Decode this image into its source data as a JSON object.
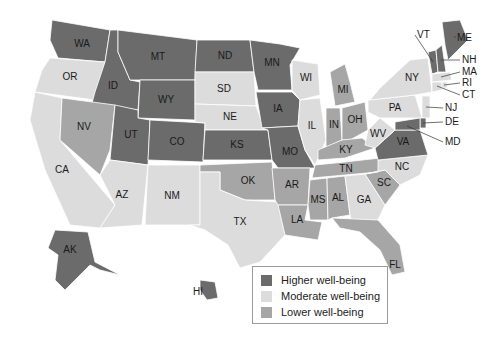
{
  "colors": {
    "higher": "#6b6b6b",
    "moderate": "#dcdcdc",
    "lower": "#a6a6a6"
  },
  "legend": {
    "items": [
      {
        "key": "higher",
        "label": "Higher well-being"
      },
      {
        "key": "moderate",
        "label": "Moderate well-being"
      },
      {
        "key": "lower",
        "label": "Lower well-being"
      }
    ]
  },
  "states": [
    {
      "code": "WA",
      "level": "higher",
      "pts": "52,20 110,30 105,62 58,58 50,40",
      "lx": 82,
      "ly": 44
    },
    {
      "code": "OR",
      "level": "moderate",
      "pts": "50,58 105,62 95,100 35,92 42,70",
      "lx": 70,
      "ly": 77
    },
    {
      "code": "CA",
      "level": "moderate",
      "pts": "35,92 62,98 60,140 115,205 100,228 70,225 45,170 30,120",
      "lx": 62,
      "ly": 170
    },
    {
      "code": "ID",
      "level": "higher",
      "pts": "110,30 118,30 118,52 130,80 140,82 138,110 92,103 95,92 105,62",
      "lx": 113,
      "ly": 86
    },
    {
      "code": "NV",
      "level": "lower",
      "pts": "62,98 115,105 110,150 100,175 60,140",
      "lx": 84,
      "ly": 127
    },
    {
      "code": "MT",
      "level": "higher",
      "pts": "118,30 197,40 195,80 140,80 130,80 118,52",
      "lx": 158,
      "ly": 57
    },
    {
      "code": "WY",
      "level": "higher",
      "pts": "140,80 195,80 195,120 138,118",
      "lx": 166,
      "ly": 100
    },
    {
      "code": "UT",
      "level": "higher",
      "pts": "115,105 138,110 138,118 150,120 148,165 110,160",
      "lx": 131,
      "ly": 135
    },
    {
      "code": "AZ",
      "level": "moderate",
      "pts": "110,160 148,165 142,225 100,228 115,205 100,175",
      "lx": 122,
      "ly": 195
    },
    {
      "code": "CO",
      "level": "higher",
      "pts": "150,120 205,123 203,162 148,160",
      "lx": 177,
      "ly": 142
    },
    {
      "code": "NM",
      "level": "moderate",
      "pts": "148,165 200,165 200,225 145,225",
      "lx": 172,
      "ly": 196
    },
    {
      "code": "ND",
      "level": "higher",
      "pts": "197,40 250,40 254,72 195,72",
      "lx": 225,
      "ly": 56
    },
    {
      "code": "SD",
      "level": "moderate",
      "pts": "195,72 254,72 256,106 195,104",
      "lx": 224,
      "ly": 89
    },
    {
      "code": "NE",
      "level": "moderate",
      "pts": "195,104 256,106 265,130 205,130 205,123 195,122",
      "lx": 230,
      "ly": 117
    },
    {
      "code": "KS",
      "level": "higher",
      "pts": "205,130 268,130 272,160 203,160",
      "lx": 237,
      "ly": 145
    },
    {
      "code": "OK",
      "level": "lower",
      "pts": "200,165 272,162 275,200 245,200 220,190 220,172 200,172",
      "lx": 248,
      "ly": 181
    },
    {
      "code": "TX",
      "level": "moderate",
      "pts": "200,172 220,172 220,190 245,200 278,202 285,235 260,262 240,268 228,245 205,230 190,225 200,225",
      "lx": 240,
      "ly": 222
    },
    {
      "code": "MN",
      "level": "higher",
      "pts": "250,40 280,44 300,48 290,65 292,90 258,90 254,72",
      "lx": 272,
      "ly": 63
    },
    {
      "code": "IA",
      "level": "higher",
      "pts": "256,92 292,92 300,100 298,126 262,128",
      "lx": 278,
      "ly": 109
    },
    {
      "code": "MO",
      "level": "higher",
      "pts": "262,128 298,126 305,150 315,168 278,168 272,160 268,130",
      "lx": 290,
      "ly": 152
    },
    {
      "code": "AR",
      "level": "lower",
      "pts": "272,168 310,168 308,205 278,205 275,200",
      "lx": 292,
      "ly": 185
    },
    {
      "code": "LA",
      "level": "lower",
      "pts": "278,205 308,205 305,220 322,222 318,240 285,235",
      "lx": 297,
      "ly": 220
    },
    {
      "code": "WI",
      "level": "moderate",
      "pts": "292,60 318,64 320,95 300,100 292,90",
      "lx": 306,
      "ly": 78
    },
    {
      "code": "IL",
      "level": "moderate",
      "pts": "300,100 320,98 326,140 315,165 305,150 298,126",
      "lx": 312,
      "ly": 126
    },
    {
      "code": "MI",
      "level": "lower",
      "pts": "330,72 345,64 350,82 355,102 335,106",
      "lx": 343,
      "ly": 90
    },
    {
      "code": "IN",
      "level": "lower",
      "pts": "326,108 340,108 342,140 326,148 326,140",
      "lx": 334,
      "ly": 125
    },
    {
      "code": "OH",
      "level": "lower",
      "pts": "342,108 365,102 368,130 350,140 342,140",
      "lx": 355,
      "ly": 120
    },
    {
      "code": "KY",
      "level": "lower",
      "pts": "318,150 342,140 362,138 375,148 345,158 318,160",
      "lx": 346,
      "ly": 150
    },
    {
      "code": "TN",
      "level": "lower",
      "pts": "315,165 345,162 380,158 378,172 312,178",
      "lx": 346,
      "ly": 169
    },
    {
      "code": "MS",
      "level": "lower",
      "pts": "310,180 327,178 328,220 310,220 308,205",
      "lx": 318,
      "ly": 200
    },
    {
      "code": "AL",
      "level": "lower",
      "pts": "327,178 345,176 350,215 332,218 328,220",
      "lx": 338,
      "ly": 198
    },
    {
      "code": "GA",
      "level": "moderate",
      "pts": "345,176 365,174 385,205 378,220 352,222 350,215",
      "lx": 364,
      "ly": 200
    },
    {
      "code": "FL",
      "level": "lower",
      "pts": "332,218 378,220 400,245 405,272 392,275 380,250 360,232 340,228",
      "lx": 395,
      "ly": 265
    },
    {
      "code": "SC",
      "level": "lower",
      "pts": "365,174 385,170 400,185 385,205",
      "lx": 384,
      "ly": 183
    },
    {
      "code": "NC",
      "level": "moderate",
      "pts": "378,160 428,155 420,175 400,185 385,170 365,174 378,172",
      "lx": 402,
      "ly": 167
    },
    {
      "code": "VA",
      "level": "higher",
      "pts": "375,148 395,130 420,130 428,155 378,160",
      "lx": 403,
      "ly": 142
    },
    {
      "code": "WV",
      "level": "moderate",
      "pts": "368,130 380,118 395,130 375,148 365,145",
      "lx": 378,
      "ly": 134
    },
    {
      "code": "PA",
      "level": "moderate",
      "pts": "368,100 415,95 422,118 380,118 368,112",
      "lx": 395,
      "ly": 108
    },
    {
      "code": "NY",
      "level": "moderate",
      "pts": "380,88 410,60 428,58 432,92 415,95 370,100",
      "lx": 412,
      "ly": 78
    },
    {
      "code": "VT",
      "level": "higher",
      "pts": "428,52 436,50 438,72 432,74",
      "lx": 433,
      "ly": 62
    },
    {
      "code": "NH",
      "level": "higher",
      "pts": "436,50 442,45 446,72 438,72",
      "lx": 441,
      "ly": 60
    },
    {
      "code": "ME",
      "level": "higher",
      "pts": "442,22 460,20 468,40 448,60 445,45",
      "lx": 455,
      "ly": 36
    },
    {
      "code": "MA",
      "level": "moderate",
      "pts": "432,74 450,72 452,80 432,82",
      "lx": 441,
      "ly": 77
    },
    {
      "code": "CT",
      "level": "moderate",
      "pts": "432,82 442,82 442,90 432,92",
      "lx": 437,
      "ly": 86
    },
    {
      "code": "RI",
      "level": "moderate",
      "pts": "442,82 447,82 447,88 442,88",
      "lx": 444,
      "ly": 85
    },
    {
      "code": "NJ",
      "level": "moderate",
      "pts": "422,96 430,96 430,118 422,118",
      "lx": 426,
      "ly": 107
    },
    {
      "code": "DE",
      "level": "higher",
      "pts": "420,118 426,118 426,128 420,128",
      "lx": 423,
      "ly": 123
    },
    {
      "code": "MD",
      "level": "higher",
      "pts": "395,122 420,118 420,130 395,130",
      "lx": 407,
      "ly": 126
    },
    {
      "code": "AK",
      "level": "higher",
      "pts": "55,230 88,232 95,262 120,275 100,270 90,265 65,290 55,280 58,255 48,248",
      "lx": 70,
      "ly": 250
    },
    {
      "code": "HI",
      "level": "higher",
      "pts": "200,280 215,282 218,298 207,300 200,290",
      "lx": 198,
      "ly": 292
    }
  ],
  "external_labels": [
    {
      "code": "VT",
      "x": 417,
      "y": 35
    },
    {
      "code": "ME",
      "x": 457,
      "y": 38
    },
    {
      "code": "NH",
      "x": 462,
      "y": 60
    },
    {
      "code": "MA",
      "x": 462,
      "y": 72
    },
    {
      "code": "RI",
      "x": 462,
      "y": 83
    },
    {
      "code": "CT",
      "x": 462,
      "y": 95
    },
    {
      "code": "NJ",
      "x": 445,
      "y": 108
    },
    {
      "code": "DE",
      "x": 445,
      "y": 122
    },
    {
      "code": "MD",
      "x": 445,
      "y": 142
    }
  ]
}
